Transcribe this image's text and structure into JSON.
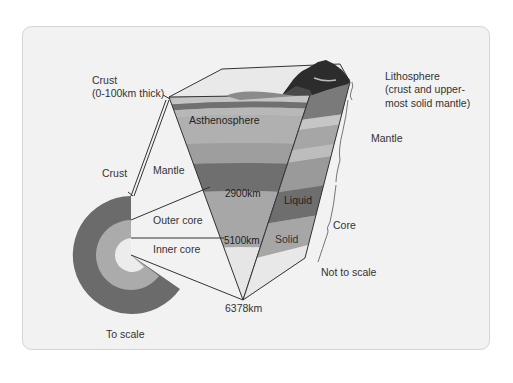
{
  "diagram": {
    "labels": {
      "crust_top": "Crust",
      "crust_top_note": "(0-100km thick)",
      "asthenosphere": "Asthenosphere",
      "lithosphere": "Lithosphere",
      "lithosphere_note_1": "(crust and upper-",
      "lithosphere_note_2": "most solid mantle)",
      "mantle_right": "Mantle",
      "mantle_left": "Mantle",
      "crust_left": "Crust",
      "depth_2900": "2900km",
      "liquid": "Liquid",
      "core": "Core",
      "outer_core": "Outer core",
      "inner_core": "Inner core",
      "depth_5100": "5100km",
      "solid": "Solid",
      "not_to_scale": "Not to scale",
      "depth_6378": "6378km",
      "to_scale": "To scale"
    },
    "colors": {
      "background_panel": "#f2f2f2",
      "panel_border": "#d6d6d6",
      "surface_dark": "#2e2e2e",
      "crust_band": "#8c8c8c",
      "upper_mantle_light": "#bdbdbd",
      "asthenosphere": "#a9a9a9",
      "mid_mantle": "#9a9a9a",
      "lower_mantle_dark": "#6e6e6e",
      "outer_core": "#a6a6a6",
      "inner_core": "#e6e6e6",
      "ring_mantle": "#6b6b6b",
      "ring_outer_core": "#ababab",
      "ring_inner_core": "#ececec",
      "line": "#333333",
      "text": "#333333"
    }
  }
}
